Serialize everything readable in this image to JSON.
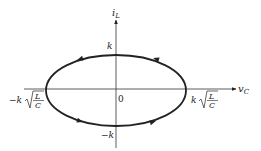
{
  "diagram": {
    "type": "phase-plane",
    "axes": {
      "x_label": "v",
      "x_sub": "C",
      "y_label": "i",
      "y_sub": "L",
      "origin_label": "0"
    },
    "labels": {
      "top_intercept": "k",
      "bottom_intercept": "−k",
      "left_intercept_prefix": "−k",
      "right_intercept_prefix": "k",
      "sqrt_numerator": "L",
      "sqrt_denominator": "C"
    },
    "trajectory": {
      "shape": "ellipse",
      "direction": "counter-clockwise",
      "arrows": 4
    },
    "colors": {
      "stroke": "#222222",
      "background": "#ffffff"
    }
  }
}
